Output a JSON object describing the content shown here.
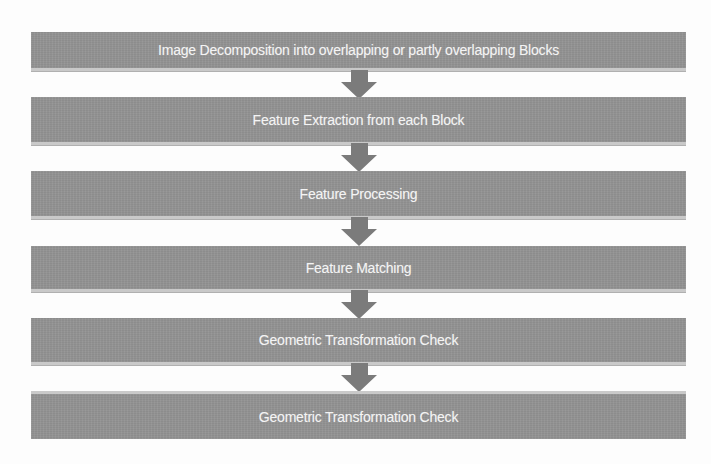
{
  "diagram": {
    "type": "vertical-flowchart",
    "colors": {
      "background": "#fdfdfd",
      "box_fill": "#929292",
      "box_text": "#f4f4f4",
      "arrow_fill": "#7b7b7b",
      "box_edge_highlight": "#c9c9c9"
    },
    "steps": [
      {
        "label": "Image Decomposition into overlapping or partly overlapping Blocks"
      },
      {
        "label": "Feature Extraction from each Block"
      },
      {
        "label": "Feature Processing"
      },
      {
        "label": "Feature Matching"
      },
      {
        "label": "Geometric Transformation Check"
      },
      {
        "label": "Geometric Transformation Check"
      }
    ],
    "connectors": [
      {
        "from": 0,
        "to": 1,
        "icon": "down-arrow-icon"
      },
      {
        "from": 1,
        "to": 2,
        "icon": "down-arrow-icon"
      },
      {
        "from": 2,
        "to": 3,
        "icon": "down-arrow-icon"
      },
      {
        "from": 3,
        "to": 4,
        "icon": "down-arrow-icon"
      },
      {
        "from": 4,
        "to": 5,
        "icon": "down-arrow-icon"
      }
    ]
  }
}
